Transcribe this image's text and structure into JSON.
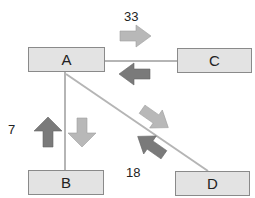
{
  "nodes": {
    "A": {
      "label": "A"
    },
    "B": {
      "label": "B"
    },
    "C": {
      "label": "C"
    },
    "D": {
      "label": "D"
    }
  },
  "edges": [
    {
      "from": "A",
      "to": "C",
      "value": "33"
    },
    {
      "from": "A",
      "to": "B",
      "value": "7"
    },
    {
      "from": "A",
      "to": "D",
      "value": "18"
    }
  ],
  "labels": {
    "ac": "33",
    "ab": "7",
    "ad": "18"
  },
  "colors": {
    "node_fill": "#e3e3e3",
    "node_border": "#8a8a8a",
    "line": "#b5b5b5",
    "arrow_light": "#b8b8b8",
    "arrow_dark": "#7a7a7a"
  }
}
